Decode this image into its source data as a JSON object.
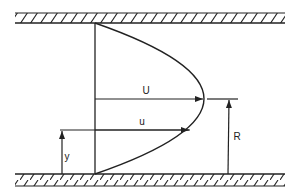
{
  "diagram": {
    "type": "velocity-profile",
    "colors": {
      "ink": "#222222",
      "background": "#ffffff"
    },
    "walls": {
      "top": {
        "x1": 15,
        "x2": 285,
        "y_top": 13,
        "y_bottom": 23
      },
      "bottom": {
        "x1": 15,
        "x2": 285,
        "y_top": 174,
        "y_bottom": 186
      }
    },
    "labels": {
      "max_velocity": "U",
      "local_velocity": "u",
      "radius": "R",
      "distance": "y"
    }
  }
}
